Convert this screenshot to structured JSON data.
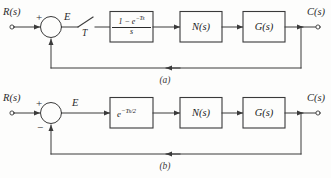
{
  "figure": {
    "type": "control-system-block-diagram",
    "background_color": "#fdfdfc",
    "line_color": "#3a3a3a"
  },
  "diagram_a": {
    "caption": "(a)",
    "input_label": "R(s)",
    "output_label": "C(s)",
    "error_label": "E",
    "summing_junction": {
      "plus_sign": "+",
      "minus_sign": ""
    },
    "sampler": {
      "name": "sampler-switch",
      "period_label": "T"
    },
    "blocks": [
      {
        "name": "zero-order-hold",
        "numerator": "1 − e",
        "numerator_exponent": "−Ts",
        "denominator": "s"
      },
      {
        "name": "nonlinearity",
        "label": "N(s)"
      },
      {
        "name": "plant",
        "label": "G(s)"
      }
    ],
    "feedback_label": ""
  },
  "diagram_b": {
    "caption": "(b)",
    "input_label": "R(s)",
    "output_label": "C(s)",
    "error_label": "E",
    "summing_junction": {
      "plus_sign": "+",
      "minus_sign": "−"
    },
    "blocks": [
      {
        "name": "delay-approximation",
        "label": "e",
        "exponent": "−Ts/2"
      },
      {
        "name": "nonlinearity",
        "label": "N(s)"
      },
      {
        "name": "plant",
        "label": "G(s)"
      }
    ],
    "feedback_label": ""
  }
}
